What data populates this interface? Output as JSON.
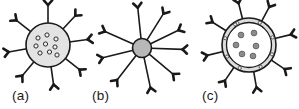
{
  "figure": {
    "type": "diagram",
    "background_color": "#ffffff",
    "width": 299,
    "height": 109,
    "panels": [
      {
        "id": "a",
        "label": "(a)",
        "label_x": 12,
        "label_y": 100,
        "body_cx": 48,
        "body_cy": 45,
        "body_r": 22,
        "body_fill": "#e3e3e3",
        "body_stroke": "#1a1a1a",
        "body_stroke_width": 1.6,
        "inner_marker_style": "hollow-ring",
        "inner_marker_r": 2.1,
        "inner_marker_fill": "#f2f2f2",
        "inner_marker_stroke": "#2b2b2b",
        "inner_markers": [
          {
            "x": 38,
            "y": 38
          },
          {
            "x": 47,
            "y": 35
          },
          {
            "x": 56,
            "y": 39
          },
          {
            "x": 36,
            "y": 46
          },
          {
            "x": 45.5,
            "y": 44
          },
          {
            "x": 55,
            "y": 47
          },
          {
            "x": 40,
            "y": 53
          },
          {
            "x": 49.5,
            "y": 52
          },
          {
            "x": 57,
            "y": 55
          }
        ],
        "spoke_count": 8,
        "spoke_length": 18,
        "spoke_stroke": "#1a1a1a",
        "spoke_stroke_width": 1.6,
        "spoke_angles_deg": [
          -90,
          -47,
          -8,
          38,
          82,
          130,
          170,
          218
        ],
        "tip_style": "Y-shaped antibody"
      },
      {
        "id": "b",
        "label": "(b)",
        "label_x": 92,
        "label_y": 100,
        "body_cx": 142,
        "body_cy": 48,
        "body_r": 9.5,
        "body_fill": "#b8b8b8",
        "body_stroke": "#1a1a1a",
        "body_stroke_width": 1.6,
        "inner_marker_style": "none",
        "inner_markers": [],
        "spoke_count": 9,
        "spoke_length": 31,
        "spoke_stroke": "#1a1a1a",
        "spoke_stroke_width": 1.6,
        "spoke_angles_deg": [
          -96,
          -58,
          -26,
          2,
          40,
          78,
          128,
          166,
          204
        ],
        "tip_style": "Y-shaped antibody"
      },
      {
        "id": "c",
        "label": "(c)",
        "label_x": 202,
        "label_y": 100,
        "body_cx": 249,
        "body_cy": 45,
        "body_r": 27,
        "body_fill": "#dcdcdc",
        "body_stroke": "#1a1a1a",
        "body_stroke_width": 1.6,
        "shell_inner_r": 22.5,
        "shell_inner_fill": "#ffffff",
        "shell_inner_stroke": "#1a1a1a",
        "inner_marker_style": "solid-dot",
        "inner_marker_r": 2.9,
        "inner_marker_fill": "#8c8c8c",
        "inner_marker_stroke": "#4d4d4d",
        "inner_markers": [
          {
            "x": 241,
            "y": 35
          },
          {
            "x": 254,
            "y": 33
          },
          {
            "x": 236,
            "y": 45
          },
          {
            "x": 256,
            "y": 46
          },
          {
            "x": 242,
            "y": 54
          },
          {
            "x": 253,
            "y": 56
          }
        ],
        "shell_marker_style": "small-embedded-pore",
        "shell_marker_r": 1.6,
        "shell_marker_fill": "#f0f0f0",
        "shell_marker_stroke": "#3a3a3a",
        "shell_marker_angles_deg": [
          -118,
          -64,
          -18,
          22,
          62,
          112,
          152,
          196,
          236
        ],
        "spoke_count": 8,
        "spoke_length": 16,
        "spoke_stroke": "#1a1a1a",
        "spoke_stroke_width": 1.6,
        "spoke_angles_deg": [
          -104,
          -62,
          -14,
          34,
          80,
          124,
          166,
          212
        ],
        "tip_style": "Y-shaped antibody"
      }
    ],
    "antibody_tip": {
      "arm_length": 6.2,
      "arm_spread_deg": 42,
      "stroke": "#1a1a1a",
      "stroke_width": 2.6,
      "fill": "#1a1a1a"
    }
  }
}
